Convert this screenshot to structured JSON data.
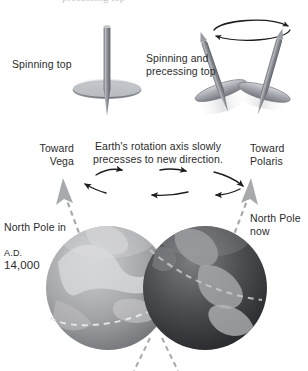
{
  "figure": {
    "background_color": "#ffffff",
    "text_color": "#2b2b2b"
  },
  "top_clipped_line": {
    "text": "precessing top",
    "note": "partially cropped line of text at the very top edge",
    "color": "#c9c9cf"
  },
  "panel_tops": {
    "spinning_top": {
      "label": "Spinning top",
      "shaft_color": "#8d9096",
      "disk_color": "#b9bcc1",
      "blur_color": "#e4e5e7"
    },
    "precessing_top": {
      "label": "Spinning and\nprecessing top",
      "shaft_color": "#8d9096",
      "disk_color": "#b9bcc1",
      "blur_color": "#e4e5e7",
      "precession_path": "ellipse with arrowheads at both ends"
    }
  },
  "panel_earth": {
    "caption": "Earth's rotation axis slowly\nprecesses to new direction.",
    "left_direction_label": "Toward\nVega",
    "right_direction_label": "Toward\nPolaris",
    "left_pole_label_line1": "North Pole in",
    "left_pole_label_ad": "A.D.",
    "left_pole_label_year": "14,000",
    "right_pole_label": "North Pole\nnow",
    "arrow_color": "#1d1d1d",
    "axis_color": "#a8a9ad",
    "arrow_rows": [
      {
        "direction": "right",
        "count": 3
      },
      {
        "direction": "left",
        "count": 3
      }
    ],
    "globes": [
      {
        "name": "earth-future",
        "side": "left",
        "tone": "light-gray",
        "equator": "dashed"
      },
      {
        "name": "earth-now",
        "side": "right",
        "tone": "dark-gray",
        "equator": "dashed"
      }
    ]
  }
}
